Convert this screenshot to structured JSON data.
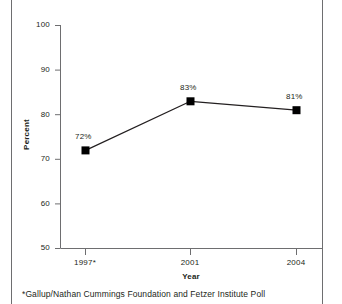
{
  "chart_data": {
    "type": "line",
    "title": "",
    "subtitle": "",
    "xlabel": "Year",
    "ylabel": "Percent",
    "categories": [
      "1997*",
      "2001",
      "2004"
    ],
    "x_values": [
      1997,
      2001,
      2004
    ],
    "values": [
      72,
      83,
      81
    ],
    "point_labels": [
      "72%",
      "83%",
      "81%"
    ],
    "ylim": [
      50,
      100
    ],
    "yticks": [
      100,
      90,
      80,
      70,
      60,
      50
    ],
    "ytick_labels": [
      "100",
      "90",
      "80",
      "70",
      "60",
      "50"
    ],
    "xtick_labels": [
      "1997*",
      "2001",
      "2004"
    ],
    "grid": false,
    "legend": false,
    "legend_position": "none",
    "marker": "square",
    "series": [
      {
        "name": "Percent",
        "values": [
          72,
          83,
          81
        ]
      }
    ],
    "annotations": [
      "*Gallup/Nathan Cummings Foundation and Fetzer Institute Poll"
    ],
    "colors": {
      "line": "#231f20",
      "marker": "#000000",
      "axis": "#6e6e70",
      "text": "#231f20",
      "background": "#ffffff"
    }
  },
  "footnote": {
    "text": "*Gallup/Nathan Cummings Foundation and Fetzer Institute Poll"
  },
  "axes": {
    "y_title": "Percent",
    "x_title": "Year",
    "y_tick_0": "100",
    "y_tick_1": "90",
    "y_tick_2": "80",
    "y_tick_3": "70",
    "y_tick_4": "60",
    "y_tick_5": "50",
    "x_tick_0": "1997*",
    "x_tick_1": "2001",
    "x_tick_2": "2004"
  },
  "points": {
    "p0_label": "72%",
    "p1_label": "83%",
    "p2_label": "81%"
  }
}
